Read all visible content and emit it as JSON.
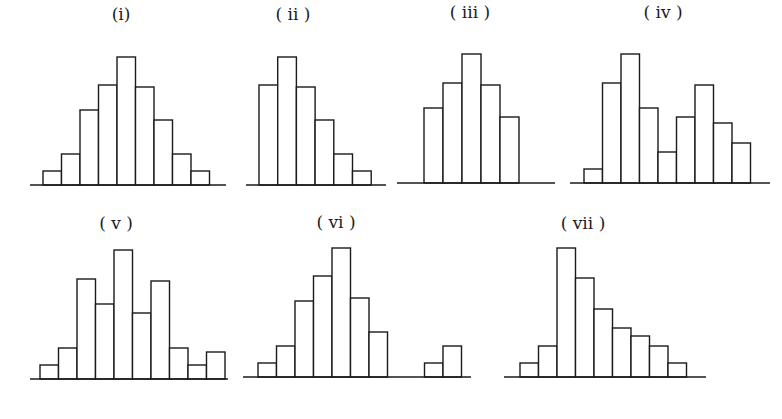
{
  "chart_data": [
    {
      "type": "bar",
      "title": "(i)",
      "description": "symmetric unimodal histogram",
      "baseline_y": 185,
      "axis_x": [
        30,
        226
      ],
      "bars_x_start": 43,
      "bar_width": 18.5,
      "label_pos": [
        121,
        20
      ],
      "values": [
        14,
        31,
        75,
        100,
        128,
        98,
        65,
        31,
        14
      ]
    },
    {
      "type": "bar",
      "title": "( ii )",
      "description": "right-skewed histogram",
      "baseline_y": 185,
      "axis_x": [
        246,
        386
      ],
      "bars_x_start": 259,
      "bar_width": 18.7,
      "label_pos": [
        293,
        20
      ],
      "values": [
        100,
        128,
        98,
        65,
        31,
        14
      ]
    },
    {
      "type": "bar",
      "title": "( iii )",
      "description": "roughly symmetric histogram with few bins",
      "baseline_y": 183,
      "axis_x": [
        397,
        555
      ],
      "bars_x_start": 424,
      "bar_width": 19,
      "label_pos": [
        470,
        18
      ],
      "values": [
        75,
        100,
        129,
        98,
        66
      ]
    },
    {
      "type": "bar",
      "title": "( iv )",
      "description": "bimodal histogram",
      "baseline_y": 183,
      "axis_x": [
        570,
        770
      ],
      "bars_x_start": 584,
      "bar_width": 18.5,
      "label_pos": [
        663,
        18
      ],
      "values": [
        14,
        100,
        129,
        75,
        31,
        66,
        98,
        60,
        40
      ]
    },
    {
      "type": "bar",
      "title": "( v )",
      "description": "multimodal histogram",
      "baseline_y": 379,
      "axis_x": [
        30,
        228
      ],
      "bars_x_start": 40,
      "bar_width": 18.5,
      "label_pos": [
        116,
        229
      ],
      "values": [
        14,
        31,
        100,
        75,
        129,
        66,
        98,
        31,
        14,
        27
      ]
    },
    {
      "type": "bar",
      "title": "( vi )",
      "description": "unimodal histogram with outlier cluster",
      "baseline_y": 377,
      "axis_x": [
        243,
        471
      ],
      "bars_x_start": 258,
      "bar_width": 18.5,
      "label_pos": [
        336,
        228
      ],
      "values": [
        14,
        31,
        76,
        101,
        129,
        79,
        45,
        0,
        0,
        14,
        31
      ]
    },
    {
      "type": "bar",
      "title": "( vii )",
      "description": "right-skewed histogram with long tail",
      "baseline_y": 377,
      "axis_x": [
        504,
        706
      ],
      "bars_x_start": 520,
      "bar_width": 18.5,
      "label_pos": [
        583,
        229
      ],
      "values": [
        14,
        31,
        129,
        99,
        68,
        49,
        41,
        31,
        14
      ]
    }
  ],
  "labels": {
    "h1": "(i)",
    "h2": "( ii )",
    "h3": "( iii )",
    "h4": "( iv )",
    "h5": "( v )",
    "h6": "( vi )",
    "h7": "( vii )"
  }
}
